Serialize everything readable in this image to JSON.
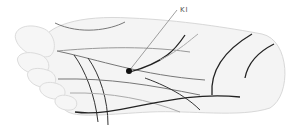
{
  "diagram": {
    "point_label": "KI",
    "colors": {
      "foot_fill": "#f4f4f4",
      "foot_outline": "#d8d8d8",
      "dark_line": "#333333",
      "mid_line": "#777777",
      "light_line": "#b5b5b5",
      "point": "#111111"
    }
  }
}
